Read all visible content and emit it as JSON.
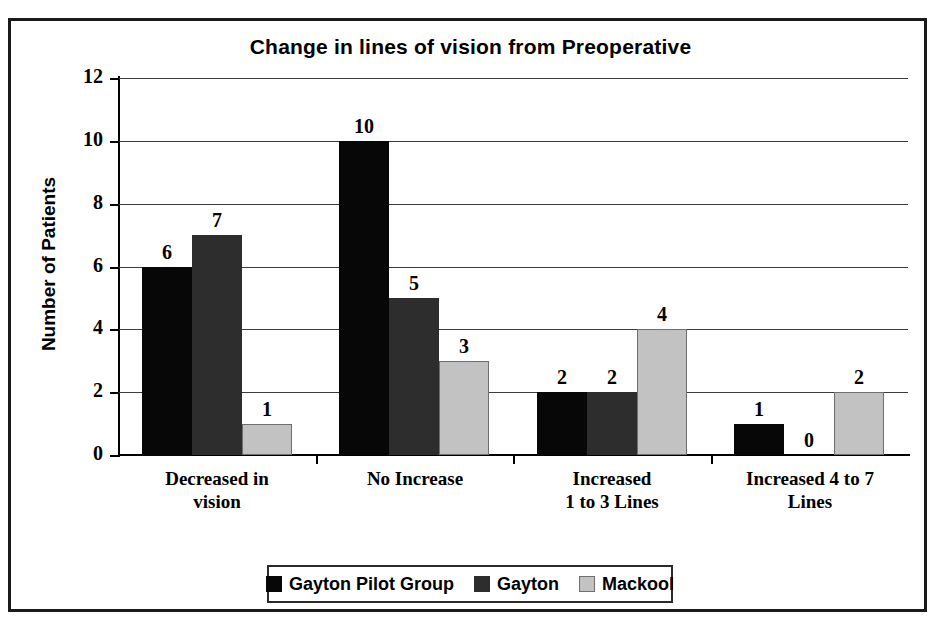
{
  "chart_data": {
    "type": "bar",
    "title": "Change in lines of vision from Preoperative",
    "xlabel": "",
    "ylabel": "Number of Patients",
    "ylim": [
      0,
      12
    ],
    "yticks": [
      0,
      2,
      4,
      6,
      8,
      10,
      12
    ],
    "grid": true,
    "legend_position": "bottom",
    "categories": [
      "Decreased in\nvision",
      "No Increase",
      "Increased\n1 to 3 Lines",
      "Increased 4 to 7\nLines"
    ],
    "category_lines": [
      [
        "Decreased in",
        "vision"
      ],
      [
        "No Increase",
        ""
      ],
      [
        "Increased",
        "1 to 3 Lines"
      ],
      [
        "Increased 4 to 7",
        "Lines"
      ]
    ],
    "series": [
      {
        "name": "Gayton Pilot Group",
        "color": "#070707",
        "values": [
          6,
          10,
          2,
          1
        ]
      },
      {
        "name": "Gayton",
        "color": "#2d2d2d",
        "values": [
          7,
          5,
          2,
          0
        ]
      },
      {
        "name": "Mackool",
        "color": "#c2c2c2",
        "values": [
          1,
          3,
          4,
          2
        ]
      }
    ],
    "data_labels": [
      [
        "6",
        "10",
        "2",
        "1"
      ],
      [
        "7",
        "5",
        "2",
        "0"
      ],
      [
        "1",
        "3",
        "4",
        "2"
      ]
    ]
  },
  "legend": {
    "items": [
      {
        "label": "Gayton Pilot Group",
        "swatch": "black-square-swatch"
      },
      {
        "label": "Gayton",
        "swatch": "dark-gray-square-swatch"
      },
      {
        "label": "Mackool",
        "swatch": "light-gray-square-swatch"
      }
    ]
  },
  "axis": {
    "y_tick_labels": [
      "12",
      "10",
      "8",
      "6",
      "4",
      "2",
      "0"
    ]
  }
}
